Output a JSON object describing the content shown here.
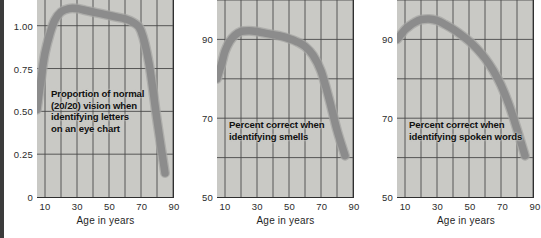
{
  "figure": {
    "background_color": "#ffffff",
    "panel_background_color": "#c9c9c5",
    "grid_color": "#4a4a4a",
    "curve_color": "#8c8c8c",
    "axis_color": "#2f2f2f"
  },
  "chart_data": [
    {
      "type": "line",
      "title": "",
      "annotation": "Proportion of normal\n(20/20) vision when\nidentifying letters\non an eye chart",
      "xlabel": "Age in years",
      "ylabel": "",
      "xlim": [
        5,
        90
      ],
      "ylim": [
        0,
        1.15
      ],
      "grid": true,
      "legend": "none",
      "xticks": [
        10,
        30,
        50,
        70,
        90
      ],
      "xtick_labels": [
        "10",
        "30",
        "50",
        "70",
        "90"
      ],
      "xgridlines": [
        10,
        20,
        30,
        40,
        50,
        60,
        70,
        80,
        90
      ],
      "yticks": [
        0,
        0.25,
        0.5,
        0.75,
        1.0
      ],
      "ytick_labels": [
        "0",
        "0.25",
        "0.50",
        "0.75",
        "1.00"
      ],
      "x": [
        5,
        8,
        10,
        13,
        16,
        20,
        25,
        30,
        35,
        40,
        45,
        50,
        55,
        60,
        65,
        70,
        75,
        80,
        85
      ],
      "values": [
        0.51,
        0.72,
        0.84,
        0.95,
        1.03,
        1.08,
        1.1,
        1.1,
        1.09,
        1.08,
        1.07,
        1.06,
        1.05,
        1.04,
        1.02,
        0.97,
        0.78,
        0.45,
        0.14
      ]
    },
    {
      "type": "line",
      "title": "",
      "annotation": "Percent correct when\nidentifying smells",
      "xlabel": "Age in years",
      "ylabel": "",
      "xlim": [
        5,
        90
      ],
      "ylim": [
        50,
        100
      ],
      "grid": true,
      "legend": "none",
      "xticks": [
        10,
        30,
        50,
        70,
        90
      ],
      "xtick_labels": [
        "10",
        "30",
        "50",
        "70",
        "90"
      ],
      "xgridlines": [
        10,
        20,
        30,
        40,
        50,
        60,
        70,
        80,
        90
      ],
      "yticks": [
        50,
        60,
        70,
        80,
        90,
        100
      ],
      "ytick_labels": [
        "50",
        "",
        "70",
        "",
        "90",
        ""
      ],
      "x": [
        5,
        8,
        10,
        13,
        16,
        20,
        25,
        30,
        35,
        40,
        45,
        50,
        55,
        60,
        65,
        70,
        75,
        80,
        85
      ],
      "values": [
        80.0,
        84.0,
        87.0,
        89.5,
        91.0,
        92.0,
        92.2,
        92.0,
        91.6,
        91.2,
        90.8,
        90.2,
        89.4,
        88.2,
        86.0,
        82.0,
        75.0,
        67.0,
        60.5
      ]
    },
    {
      "type": "line",
      "title": "",
      "annotation": "Percent correct when\nidentifying spoken words",
      "xlabel": "Age in years",
      "ylabel": "",
      "xlim": [
        5,
        90
      ],
      "ylim": [
        50,
        100
      ],
      "grid": true,
      "legend": "none",
      "xticks": [
        10,
        30,
        50,
        70,
        90
      ],
      "xtick_labels": [
        "10",
        "30",
        "50",
        "70",
        "90"
      ],
      "xgridlines": [
        10,
        20,
        30,
        40,
        50,
        60,
        70,
        80,
        90
      ],
      "yticks": [
        50,
        60,
        70,
        80,
        90,
        100
      ],
      "ytick_labels": [
        "50",
        "",
        "70",
        "",
        "90",
        ""
      ],
      "x": [
        5,
        8,
        10,
        13,
        16,
        20,
        25,
        30,
        35,
        40,
        45,
        50,
        55,
        60,
        65,
        70,
        75,
        80,
        85
      ],
      "values": [
        90.0,
        91.5,
        92.5,
        93.5,
        94.3,
        95.0,
        95.2,
        94.8,
        93.8,
        92.6,
        91.2,
        89.6,
        87.6,
        85.2,
        82.2,
        78.4,
        73.4,
        67.2,
        60.5
      ]
    }
  ]
}
